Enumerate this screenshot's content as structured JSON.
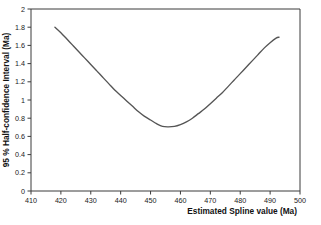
{
  "chart_data": {
    "type": "line",
    "title": "",
    "subtitle": "",
    "xlabel": "Estimated Spline value (Ma)",
    "ylabel": "95 % Half-confidence Interval (Ma)",
    "xlim": [
      410,
      500
    ],
    "ylim": [
      0,
      2
    ],
    "xticks": [
      410,
      420,
      430,
      440,
      450,
      460,
      470,
      480,
      490,
      500
    ],
    "xtick_labels": [
      "410",
      "420",
      "430",
      "440",
      "450",
      "460",
      "470",
      "480",
      "490",
      "500"
    ],
    "yticks": [
      0,
      0.2,
      0.4,
      0.6,
      0.8,
      1,
      1.2,
      1.4,
      1.6,
      1.8,
      2
    ],
    "ytick_labels": [
      "0",
      "0.2",
      "0.4",
      "0.6",
      "0.8",
      "1",
      "1.2",
      "1.4",
      "1.6",
      "1.8",
      "2"
    ],
    "grid": false,
    "legend": false,
    "legend_position": "none",
    "annotations": [],
    "curve_color": "#555555",
    "frame_color": "#3b3b3b",
    "background_color": "#ffffff",
    "series": [
      {
        "name": "95 % Half-confidence Interval",
        "x": [
          418.0,
          420.0,
          422.0,
          424.0,
          426.0,
          428.0,
          430.0,
          432.0,
          434.0,
          436.0,
          438.0,
          440.0,
          442.0,
          444.0,
          446.0,
          448.0,
          450.0,
          452.0,
          454.0,
          456.0,
          458.0,
          460.0,
          462.0,
          464.0,
          466.0,
          468.0,
          470.0,
          472.0,
          474.0,
          476.0,
          478.0,
          480.0,
          482.0,
          484.0,
          486.0,
          488.0,
          490.0,
          492.0,
          493.0
        ],
        "y": [
          1.8,
          1.74,
          1.67,
          1.6,
          1.53,
          1.46,
          1.39,
          1.32,
          1.25,
          1.18,
          1.11,
          1.05,
          0.99,
          0.93,
          0.87,
          0.82,
          0.78,
          0.74,
          0.71,
          0.705,
          0.71,
          0.73,
          0.76,
          0.8,
          0.85,
          0.9,
          0.96,
          1.02,
          1.08,
          1.15,
          1.22,
          1.29,
          1.36,
          1.43,
          1.5,
          1.57,
          1.63,
          1.68,
          1.69
        ]
      }
    ],
    "minimum": {
      "x": 455.0,
      "y": 0.7
    }
  },
  "axis": {
    "x_title": "Estimated Spline value (Ma)",
    "y_title": "95 % Half-confidence Interval (Ma)"
  }
}
